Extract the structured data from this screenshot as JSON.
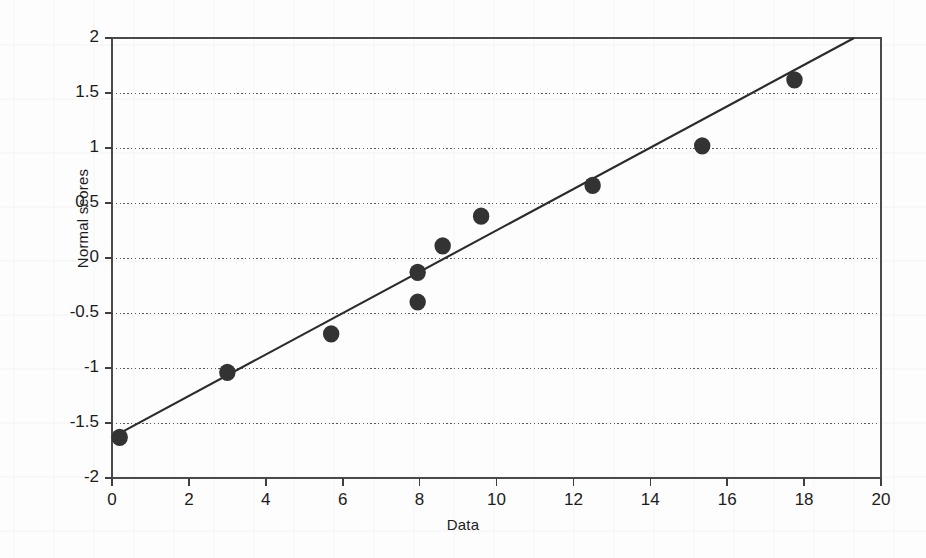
{
  "chart_data": {
    "type": "scatter",
    "title": "",
    "xlabel": "Data",
    "ylabel": "Normal scores",
    "xlim": [
      0,
      20
    ],
    "ylim": [
      -2,
      2
    ],
    "xticks": [
      0,
      2,
      4,
      6,
      8,
      10,
      12,
      14,
      16,
      18,
      20
    ],
    "yticks": [
      2,
      1.5,
      1,
      0.5,
      0,
      -0.5,
      -1,
      -1.5,
      -2
    ],
    "xtick_labels": [
      "0",
      "2",
      "4",
      "6",
      "8",
      "10",
      "12",
      "14",
      "16",
      "18",
      "20"
    ],
    "ytick_labels": [
      "2",
      "1.5",
      "1",
      "0.5",
      "0",
      "-0.5",
      "-1",
      "-1.5",
      "-2"
    ],
    "grid": "horizontal-dotted",
    "legend": "none",
    "series": [
      {
        "name": "Normal probability plot points",
        "marker": "filled-circle",
        "marker_color": "#333333",
        "points": [
          {
            "x": 0.2,
            "y": -1.63
          },
          {
            "x": 3.0,
            "y": -1.04
          },
          {
            "x": 5.7,
            "y": -0.69
          },
          {
            "x": 7.95,
            "y": -0.13
          },
          {
            "x": 7.95,
            "y": -0.4
          },
          {
            "x": 8.6,
            "y": 0.11
          },
          {
            "x": 9.6,
            "y": 0.38
          },
          {
            "x": 12.5,
            "y": 0.66
          },
          {
            "x": 15.35,
            "y": 1.02
          },
          {
            "x": 17.75,
            "y": 1.62
          }
        ]
      },
      {
        "name": "fitted straight line",
        "type": "line",
        "color": "#2b2b2b",
        "x_start": 0.0,
        "y_start": -1.63,
        "x_end": 19.3,
        "y_end": 2.0
      }
    ]
  },
  "axes": {
    "y_axis_title": "Normal scores",
    "x_axis_title": "Data"
  }
}
